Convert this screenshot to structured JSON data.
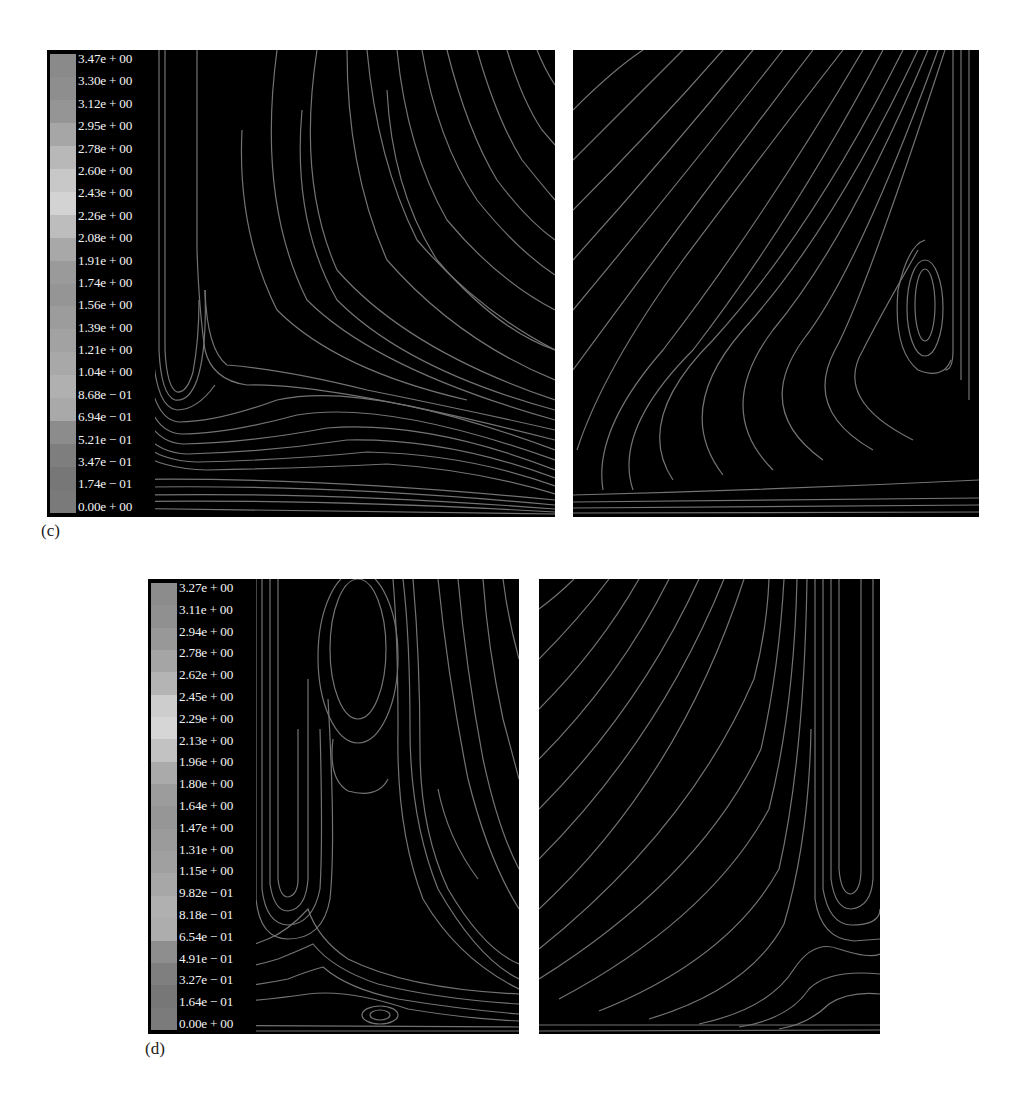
{
  "figure": {
    "panel_c": {
      "label": "(c)",
      "colorbar": {
        "ticks": [
          "3.47e + 00",
          "3.30e + 00",
          "3.12e + 00",
          "2.95e + 00",
          "2.78e + 00",
          "2.60e + 00",
          "2.43e + 00",
          "2.26e + 00",
          "2.08e + 00",
          "1.91e + 00",
          "1.74e + 00",
          "1.56e + 00",
          "1.39e + 00",
          "1.21e + 00",
          "1.04e + 00",
          "8.68e − 01",
          "6.94e − 01",
          "5.21e − 01",
          "3.47e − 01",
          "1.74e − 01",
          "0.00e + 00"
        ],
        "swatch_colors": [
          "#8a8a8a",
          "#8e8e8e",
          "#959595",
          "#a6a6a6",
          "#b8b8b8",
          "#c8c8c8",
          "#d3d3d3",
          "#bdbdbd",
          "#a8a8a8",
          "#9a9a9a",
          "#959595",
          "#9c9c9c",
          "#a2a2a2",
          "#a8a8a8",
          "#b0b0b0",
          "#a9a9a9",
          "#8c8c8c",
          "#7e7e7e",
          "#777777",
          "#7a7a7a"
        ]
      }
    },
    "panel_d": {
      "label": "(d)",
      "colorbar": {
        "ticks": [
          "3.27e + 00",
          "3.11e + 00",
          "2.94e + 00",
          "2.78e + 00",
          "2.62e + 00",
          "2.45e + 00",
          "2.29e + 00",
          "2.13e + 00",
          "1.96e + 00",
          "1.80e + 00",
          "1.64e + 00",
          "1.47e + 00",
          "1.31e + 00",
          "1.15e + 00",
          "9.82e − 01",
          "8.18e − 01",
          "6.54e − 01",
          "4.91e − 01",
          "3.27e − 01",
          "1.64e − 01",
          "0.00e + 00"
        ],
        "swatch_colors": [
          "#8c8c8c",
          "#909090",
          "#989898",
          "#a5a5a5",
          "#b4b4b4",
          "#cdcdcd",
          "#d6d6d6",
          "#c2c2c2",
          "#aaaaaa",
          "#9c9c9c",
          "#969696",
          "#9b9b9b",
          "#a0a0a0",
          "#a7a7a7",
          "#b0b0b0",
          "#adadad",
          "#8e8e8e",
          "#7f7f7f",
          "#777777",
          "#7b7b7b"
        ]
      }
    },
    "streamline_color": "#7a7a7a",
    "background_color": "#000000"
  },
  "chart_data": [
    {
      "type": "heatmap",
      "title": "(c) streamlines, left panel with velocity colorbar",
      "colorbar_ticks": [
        3.47,
        3.3,
        3.12,
        2.95,
        2.78,
        2.6,
        2.43,
        2.26,
        2.08,
        1.91,
        1.74,
        1.56,
        1.39,
        1.21,
        1.04,
        0.868,
        0.694,
        0.521,
        0.347,
        0.174,
        0.0
      ],
      "colorbar_range": [
        0.0,
        3.47
      ],
      "features": [
        "vertical jet descending near left wall",
        "stagnation at ~(x=0.2,y=0.75)",
        "recirculation lobe above floor",
        "streamlines sweeping right along floor"
      ]
    },
    {
      "type": "heatmap",
      "title": "(c) streamlines, right panel",
      "features": [
        "jet along right wall",
        "recirculation vortex near right wall at mid-height",
        "wide counter-clockwise sweep across domain"
      ]
    },
    {
      "type": "heatmap",
      "title": "(d) streamlines, left panel with velocity colorbar",
      "colorbar_ticks": [
        3.27,
        3.11,
        2.94,
        2.78,
        2.62,
        2.45,
        2.29,
        2.13,
        1.96,
        1.8,
        1.64,
        1.47,
        1.31,
        1.15,
        0.982,
        0.818,
        0.654,
        0.491,
        0.327,
        0.164,
        0.0
      ],
      "colorbar_range": [
        0.0,
        3.27
      ],
      "features": [
        "two vertical jets",
        "elongated upper vortex between jets",
        "small floor vortex near center-bottom",
        "saddle point above floor"
      ]
    },
    {
      "type": "heatmap",
      "title": "(d) streamlines, right panel",
      "features": [
        "jet along right side",
        "curved streamlines fanning from upper-left to floor",
        "recirculation near right jet tip"
      ]
    }
  ]
}
